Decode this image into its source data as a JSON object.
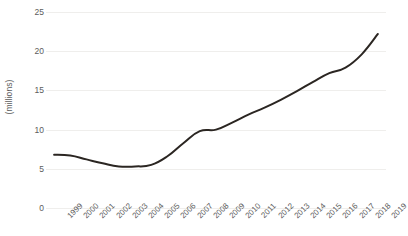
{
  "chart_data": {
    "type": "line",
    "title": "",
    "xlabel": "",
    "ylabel": "(millions)",
    "categories": [
      "1999",
      "2000",
      "2001",
      "2002",
      "2003",
      "2004",
      "2005",
      "2006",
      "2007",
      "2008",
      "2009",
      "2010",
      "2011",
      "2012",
      "2013",
      "2014",
      "2015",
      "2016",
      "2017",
      "2018",
      "2019"
    ],
    "values": [
      6.8,
      6.7,
      6.2,
      5.7,
      5.3,
      5.3,
      5.5,
      6.6,
      8.3,
      9.8,
      10.0,
      10.9,
      11.9,
      12.8,
      13.8,
      14.9,
      16.1,
      17.2,
      17.9,
      19.6,
      22.2
    ],
    "series": [
      {
        "name": "",
        "values": [
          6.8,
          6.7,
          6.2,
          5.7,
          5.3,
          5.3,
          5.5,
          6.6,
          8.3,
          9.8,
          10.0,
          10.9,
          11.9,
          12.8,
          13.8,
          14.9,
          16.1,
          17.2,
          17.9,
          19.6,
          22.2
        ]
      }
    ],
    "ylim": [
      0,
      25
    ],
    "yticks": [
      "0",
      "5",
      "10",
      "15",
      "20",
      "25"
    ],
    "ytick_values": [
      0,
      5,
      10,
      15,
      20,
      25
    ],
    "grid": true,
    "legend": "none",
    "line_color": "#2b2622",
    "grid_color": "#efeeec",
    "text_color": "#5c5c5c",
    "background_color": "#ffffff"
  }
}
